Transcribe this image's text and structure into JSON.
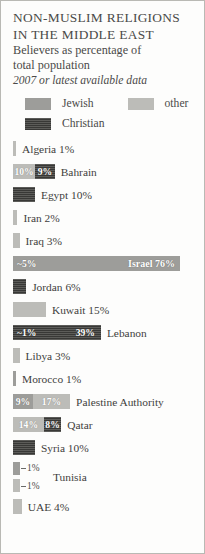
{
  "card": {
    "title_line1": "NON-MUSLIM RELIGIONS",
    "title_line2": "IN THE MIDDLE EAST",
    "subtitle_line1": "Believers as percentage of",
    "subtitle_line2": "total population",
    "source_note": "2007 or latest available data"
  },
  "legend": {
    "jewish": {
      "label": "Jewish",
      "color": "#9d9d9a"
    },
    "other": {
      "label": "other",
      "color": "#bcbcb8"
    },
    "christian": {
      "label": "Christian",
      "color": "#4e4e4c"
    }
  },
  "chart_data": {
    "type": "bar",
    "title": "NON-MUSLIM RELIGIONS IN THE MIDDLE EAST",
    "subtitle": "Believers as percentage of total population",
    "annotation": "2007 or latest available data",
    "xlabel": "",
    "ylabel": "",
    "xlim": [
      0,
      76
    ],
    "grid": false,
    "legend_position": "top",
    "orientation": "horizontal-stacked",
    "unit": "percent of total population",
    "categories": [
      "Algeria",
      "Bahrain",
      "Egypt",
      "Iran",
      "Iraq",
      "Israel",
      "Jordan",
      "Kuwait",
      "Lebanon",
      "Libya",
      "Morocco",
      "Palestine Authority",
      "Qatar",
      "Syria",
      "Tunisia",
      "UAE"
    ],
    "series": [
      {
        "name": "Jewish",
        "values": [
          0,
          0,
          0,
          0,
          0,
          76,
          0,
          0,
          1,
          0,
          1,
          9,
          0,
          0,
          1,
          0
        ]
      },
      {
        "name": "other",
        "values": [
          1,
          10,
          0,
          2,
          3,
          5,
          0,
          15,
          0,
          3,
          0,
          17,
          14,
          0,
          1,
          4
        ]
      },
      {
        "name": "Christian",
        "values": [
          0,
          9,
          10,
          0,
          0,
          0,
          6,
          0,
          39,
          0,
          0,
          0,
          8,
          10,
          0,
          0
        ]
      }
    ],
    "rows": [
      {
        "country": "Algeria",
        "label": "Algeria 1%",
        "label_position": "outside",
        "segments": [
          {
            "series": "other",
            "value": 1,
            "label": "",
            "show_label": false
          }
        ]
      },
      {
        "country": "Bahrain",
        "label": "Bahrain",
        "label_position": "outside",
        "segments": [
          {
            "series": "other",
            "value": 10,
            "label": "10%",
            "show_label": true
          },
          {
            "series": "Christian",
            "value": 9,
            "label": "9%",
            "show_label": true
          }
        ]
      },
      {
        "country": "Egypt",
        "label": "Egypt 10%",
        "label_position": "outside",
        "segments": [
          {
            "series": "Christian",
            "value": 10,
            "label": "",
            "show_label": false
          }
        ]
      },
      {
        "country": "Iran",
        "label": "Iran 2%",
        "label_position": "outside",
        "segments": [
          {
            "series": "other",
            "value": 2,
            "label": "",
            "show_label": false
          }
        ]
      },
      {
        "country": "Iraq",
        "label": "Iraq 3%",
        "label_position": "outside",
        "segments": [
          {
            "series": "other",
            "value": 3,
            "label": "",
            "show_label": false
          }
        ]
      },
      {
        "country": "Israel",
        "label": "Israel 76%",
        "label_position": "inside",
        "segments": [
          {
            "series": "Jewish",
            "value": 76,
            "label": "~5%",
            "show_label": true,
            "label_align": "left"
          }
        ]
      },
      {
        "country": "Jordan",
        "label": "Jordan 6%",
        "label_position": "outside",
        "segments": [
          {
            "series": "Christian",
            "value": 6,
            "label": "",
            "show_label": false
          }
        ]
      },
      {
        "country": "Kuwait",
        "label": "Kuwait 15%",
        "label_position": "outside",
        "segments": [
          {
            "series": "other",
            "value": 15,
            "label": "",
            "show_label": false
          }
        ]
      },
      {
        "country": "Lebanon",
        "label": "Lebanon",
        "label_position": "outside",
        "segments": [
          {
            "series": "Christian",
            "value": 40,
            "label": "~1%",
            "show_label": true,
            "label_align": "left",
            "second_label": "39%"
          }
        ]
      },
      {
        "country": "Libya",
        "label": "Libya 3%",
        "label_position": "outside",
        "segments": [
          {
            "series": "other",
            "value": 3,
            "label": "",
            "show_label": false
          }
        ]
      },
      {
        "country": "Morocco",
        "label": "Morocco 1%",
        "label_position": "outside",
        "segments": [
          {
            "series": "Jewish",
            "value": 1,
            "label": "",
            "show_label": false
          }
        ]
      },
      {
        "country": "Palestine Authority",
        "label": "Palestine Authority",
        "label_position": "outside",
        "segments": [
          {
            "series": "Jewish",
            "value": 9,
            "label": "9%",
            "show_label": true
          },
          {
            "series": "other",
            "value": 17,
            "label": "17%",
            "show_label": true
          }
        ]
      },
      {
        "country": "Qatar",
        "label": "Qatar",
        "label_position": "outside",
        "segments": [
          {
            "series": "other",
            "value": 14,
            "label": "14%",
            "show_label": true
          },
          {
            "series": "Christian",
            "value": 8,
            "label": "8%",
            "show_label": true
          }
        ]
      },
      {
        "country": "Syria",
        "label": "Syria 10%",
        "label_position": "outside",
        "segments": [
          {
            "series": "Christian",
            "value": 10,
            "label": "",
            "show_label": false
          }
        ]
      },
      {
        "country": "Tunisia",
        "label": "Tunisia",
        "label_position": "callout",
        "callout_top": "1%",
        "callout_bottom": "1%",
        "segments": [
          {
            "series": "Jewish",
            "value": 1,
            "label": "~1%",
            "show_label": false
          },
          {
            "series": "other",
            "value": 1,
            "label": "~1%",
            "show_label": false
          }
        ]
      },
      {
        "country": "UAE",
        "label": "UAE 4%",
        "label_position": "outside",
        "segments": [
          {
            "series": "other",
            "value": 4,
            "label": "",
            "show_label": false
          }
        ]
      }
    ]
  }
}
